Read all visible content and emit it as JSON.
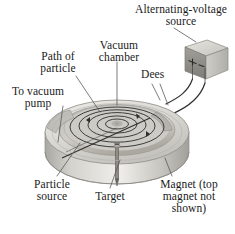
{
  "figure": {
    "background_color": "#ffffff",
    "text_color": "#1a1a1a"
  },
  "labels": {
    "alternating_voltage_source": "Alternating-voltage\nsource",
    "vacuum_chamber": "Vacuum\nchamber",
    "path_of_particle": "Path of\nparticle",
    "dees": "Dees",
    "to_vacuum_pump": "To vacuum\npump",
    "particle_source": "Particle\nsource",
    "target": "Target",
    "magnet": "Magnet (top\nmagnet not\nshown)"
  },
  "source_box": {
    "positive_terminal": "+",
    "negative_terminal": "−",
    "face_color": "#8f8f8f",
    "top_color": "#d8d6d0",
    "side_color": "#b9b7b1"
  },
  "cyclotron": {
    "body_color": "#d6d4cf",
    "rim_color": "#bcbab4",
    "cavity_color": "#b4b2ac",
    "spiral_color": "#3d3d3d",
    "spiral_turns": 5,
    "beam_line_color": "#2f2f2f",
    "target_rod_color": "#6a6a6a"
  },
  "leader_lines": {
    "color": "#5a5a5a",
    "width": 0.8
  }
}
